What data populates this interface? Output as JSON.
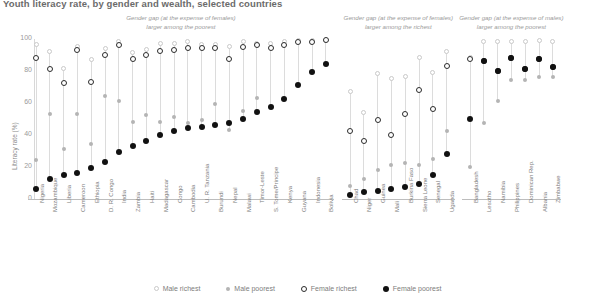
{
  "title": "Youth literacy rate, by gender and wealth, selected countries",
  "axes": {
    "ylabel": "Literacy rate (%)",
    "yticks": [
      0,
      20,
      40,
      60,
      80,
      100
    ],
    "ylim": [
      0,
      100
    ]
  },
  "annotations": [
    {
      "id": "panel-1-annotation",
      "line1": "Gender gap (at the expense of females)",
      "line2": "larger among the poorest"
    },
    {
      "id": "panel-2-annotation",
      "line1": "Gender gap (at the expense of females)",
      "line2": "larger among the richest"
    },
    {
      "id": "panel-3-annotation",
      "line1": "Gender gap (at the expense of males)",
      "line2": "larger among the poorest"
    }
  ],
  "legend": {
    "position": "bottom-center",
    "items": [
      {
        "label": "Male richest",
        "marker": "open-circle-light",
        "color": "#c9c9c9"
      },
      {
        "label": "Male poorest",
        "marker": "filled-circle-gray",
        "color": "#b4b4b4"
      },
      {
        "label": "Female richest",
        "marker": "open-circle-dark",
        "color": "#2b2b2b"
      },
      {
        "label": "Female poorest",
        "marker": "filled-circle-black",
        "color": "#111111"
      }
    ]
  },
  "chart_data": {
    "type": "scatter",
    "title": "Youth literacy rate, by gender and wealth, selected countries",
    "xlabel": "",
    "ylabel": "Literacy rate (%)",
    "ylim": [
      0,
      100
    ],
    "grid": false,
    "series": [
      {
        "name": "Male richest",
        "key": "male_richest"
      },
      {
        "name": "Male poorest",
        "key": "male_poorest"
      },
      {
        "name": "Female richest",
        "key": "female_richest"
      },
      {
        "name": "Female poorest",
        "key": "female_poorest"
      }
    ],
    "panels": [
      {
        "id": "panel-1",
        "annotation": "Gender gap (at the expense of females) larger among the poorest",
        "categories": [
          "Nigeria",
          "Mozambique",
          "Liberia",
          "Cameroon",
          "Ethiopia",
          "D. R. Congo",
          "India",
          "Zambia",
          "Haiti",
          "Madagascar",
          "Congo",
          "Cambodia",
          "U. R. Tanzania",
          "Burundi",
          "Nepal",
          "Malawi",
          "Timor-Leste",
          "S. Tome/Principe",
          "Kenya",
          "Guyana",
          "Indonesia",
          "Bolivia"
        ],
        "male_richest": [
          96,
          92,
          81,
          95,
          87,
          94,
          98,
          91,
          93,
          97,
          97,
          98,
          96,
          96,
          95,
          98,
          97,
          97,
          98,
          99,
          99,
          99
        ],
        "male_poorest": [
          24,
          53,
          31,
          53,
          34,
          64,
          61,
          48,
          52,
          48,
          51,
          47,
          49,
          59,
          43,
          55,
          63,
          57,
          62,
          71,
          79,
          84
        ],
        "female_richest": [
          88,
          81,
          72,
          93,
          73,
          90,
          96,
          87,
          90,
          92,
          93,
          94,
          94,
          94,
          87,
          95,
          96,
          94,
          96,
          98,
          98,
          99
        ],
        "female_poorest": [
          6,
          12,
          15,
          16,
          19,
          23,
          29,
          33,
          36,
          40,
          42,
          44,
          45,
          46,
          47,
          50,
          54,
          57,
          62,
          71,
          79,
          84
        ]
      },
      {
        "id": "panel-2",
        "annotation": "Gender gap (at the expense of females) larger among the richest",
        "categories": [
          "Chad",
          "Niger",
          "Guinea",
          "Mali",
          "Burkina Faso",
          "Sierra Leone",
          "Senegal",
          "Uganda"
        ],
        "male_richest": [
          67,
          54,
          78,
          75,
          76,
          88,
          79,
          92
        ],
        "male_poorest": [
          8,
          12,
          18,
          21,
          22,
          21,
          25,
          42
        ],
        "female_richest": [
          42,
          36,
          49,
          40,
          53,
          68,
          56,
          83
        ],
        "female_poorest": [
          2,
          4,
          5,
          6,
          7,
          9,
          15,
          28
        ]
      },
      {
        "id": "panel-3",
        "annotation": "Gender gap (at the expense of males) larger among the poorest",
        "categories": [
          "Bangladesh",
          "Lesotho",
          "Namibia",
          "Philippines",
          "Dominican Rep.",
          "Albania",
          "Zimbabwe"
        ],
        "male_richest": [
          88,
          98,
          98,
          98,
          98,
          99,
          98
        ],
        "male_poorest": [
          20,
          47,
          61,
          74,
          74,
          76,
          76
        ],
        "female_richest": [
          87,
          86,
          80,
          88,
          81,
          87,
          82
        ],
        "female_poorest": [
          50,
          86,
          80,
          88,
          81,
          87,
          82
        ]
      }
    ]
  }
}
